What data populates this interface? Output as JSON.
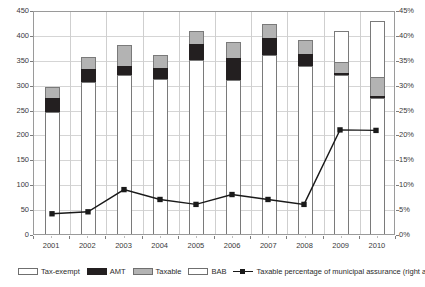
{
  "chart_data": {
    "type": "bar",
    "title": "",
    "subtitle": "",
    "xlabel": "",
    "ylabel": "",
    "y2label": "",
    "grid": true,
    "legend_position": "bottom",
    "categories": [
      "2001",
      "2002",
      "2003",
      "2004",
      "2005",
      "2006",
      "2007",
      "2008",
      "2009",
      "2010"
    ],
    "ylim": [
      0,
      450
    ],
    "y_ticks": [
      0,
      50,
      100,
      150,
      200,
      250,
      300,
      350,
      400,
      450
    ],
    "y_tick_labels": [
      "0",
      "50",
      "100",
      "150",
      "200",
      "250",
      "300",
      "350",
      "400",
      "450"
    ],
    "y2lim": [
      0,
      45
    ],
    "y2_ticks": [
      0,
      5,
      10,
      15,
      20,
      25,
      30,
      35,
      40,
      45
    ],
    "y2_tick_labels": [
      "0%",
      "5%",
      "10%",
      "15%",
      "20%",
      "25%",
      "30%",
      "35%",
      "40%",
      "45%"
    ],
    "stacked": true,
    "series": [
      {
        "name": "Tax-exempt",
        "kind": "bar",
        "axis": "left",
        "color": "#ffffff",
        "values": [
          246,
          306,
          319,
          311,
          349,
          309,
          359,
          338,
          320,
          273
        ]
      },
      {
        "name": "AMT",
        "kind": "bar",
        "axis": "left",
        "color": "#231f20",
        "values": [
          27,
          25,
          19,
          23,
          32,
          45,
          34,
          23,
          3,
          4
        ]
      },
      {
        "name": "Taxable",
        "kind": "bar",
        "axis": "left",
        "color": "#b3b3b3",
        "values": [
          23,
          25,
          41,
          25,
          26,
          31,
          29,
          28,
          22,
          39
        ]
      },
      {
        "name": "BAB",
        "kind": "bar",
        "axis": "left",
        "color": "#ffffff",
        "pattern": "dotted",
        "values": [
          0,
          0,
          0,
          0,
          0,
          0,
          0,
          0,
          63,
          112
        ]
      },
      {
        "name": "Taxable percentage of municipal assurance (right axis)",
        "kind": "line",
        "axis": "right",
        "color": "#1a1a1a",
        "marker": "square",
        "values": [
          4.1,
          4.5,
          9.0,
          7.0,
          6.0,
          8.0,
          7.0,
          6.0,
          21.1,
          21.0
        ]
      }
    ],
    "bar_totals": [
      296,
      356,
      379,
      359,
      407,
      385,
      422,
      389,
      408,
      428
    ]
  },
  "legend": {
    "items": [
      {
        "label": "Tax-exempt",
        "swatch": "taxexempt-swatch"
      },
      {
        "label": "AMT",
        "swatch": "amt-swatch"
      },
      {
        "label": "Taxable",
        "swatch": "taxable-swatch"
      },
      {
        "label": "BAB",
        "swatch": "bab-swatch"
      },
      {
        "label": "Taxable percentage of municipal assurance (right axis)",
        "swatch": "line-marker-swatch"
      }
    ]
  },
  "colors": {
    "tax_exempt": "#ffffff",
    "amt": "#231f20",
    "taxable": "#b3b3b3",
    "bab": "#ffffff",
    "line": "#1a1a1a",
    "gridline": "#d5d5d5",
    "axis": "#9a9a9a",
    "text": "#3a3a3a",
    "background": "#ffffff"
  }
}
